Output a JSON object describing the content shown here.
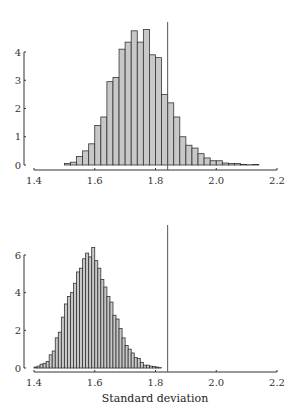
{
  "chart_data": [
    {
      "type": "bar",
      "title": "",
      "xlabel": "",
      "ylabel": "",
      "bin_width": 0.02,
      "xlim": [
        1.4,
        2.2
      ],
      "ylim": [
        0,
        4
      ],
      "xticks": [
        "1.4",
        "1.6",
        "1.8",
        "2.0",
        "2.2"
      ],
      "yticks": [
        "0",
        "1",
        "2",
        "3",
        "4"
      ],
      "grid": false,
      "reference_line_x": 1.84,
      "bins": [
        1.5,
        1.52,
        1.54,
        1.56,
        1.58,
        1.6,
        1.62,
        1.64,
        1.66,
        1.68,
        1.7,
        1.72,
        1.74,
        1.76,
        1.78,
        1.8,
        1.82,
        1.84,
        1.86,
        1.88,
        1.9,
        1.92,
        1.94,
        1.96,
        1.98,
        2.0,
        2.02,
        2.04,
        2.06,
        2.08,
        2.1,
        2.12
      ],
      "values": [
        0.05,
        0.1,
        0.3,
        0.5,
        0.75,
        1.4,
        1.7,
        2.95,
        3.1,
        4.1,
        4.35,
        4.75,
        4.35,
        4.8,
        3.9,
        3.8,
        2.5,
        2.2,
        1.7,
        1.0,
        0.7,
        0.6,
        0.4,
        0.25,
        0.15,
        0.15,
        0.07,
        0.05,
        0.05,
        0.02,
        0.01,
        0.02
      ]
    },
    {
      "type": "bar",
      "title": "",
      "xlabel": "Standard deviation",
      "ylabel": "",
      "bin_width": 0.01,
      "xlim": [
        1.4,
        2.2
      ],
      "ylim": [
        0,
        6
      ],
      "xticks": [
        "1.4",
        "1.6",
        "1.8",
        "2.0",
        "2.2"
      ],
      "yticks": [
        "0",
        "2",
        "4",
        "6"
      ],
      "grid": false,
      "reference_line_x": 1.84,
      "bins": [
        1.4,
        1.41,
        1.42,
        1.43,
        1.44,
        1.45,
        1.46,
        1.47,
        1.48,
        1.49,
        1.5,
        1.51,
        1.52,
        1.53,
        1.54,
        1.55,
        1.56,
        1.57,
        1.58,
        1.59,
        1.6,
        1.61,
        1.62,
        1.63,
        1.64,
        1.65,
        1.66,
        1.67,
        1.68,
        1.69,
        1.7,
        1.71,
        1.72,
        1.73,
        1.74,
        1.75,
        1.76,
        1.77,
        1.78,
        1.79,
        1.8,
        1.81
      ],
      "values": [
        0.05,
        0.1,
        0.2,
        0.25,
        0.35,
        0.7,
        0.9,
        1.6,
        1.9,
        2.7,
        3.4,
        3.8,
        4.0,
        4.5,
        5.1,
        5.3,
        5.8,
        6.1,
        5.9,
        6.4,
        5.7,
        5.3,
        4.7,
        4.3,
        3.8,
        3.5,
        2.8,
        2.6,
        2.1,
        1.6,
        1.2,
        1.0,
        0.8,
        0.55,
        0.5,
        0.3,
        0.15,
        0.15,
        0.1,
        0.08,
        0.05,
        0.02
      ]
    }
  ]
}
